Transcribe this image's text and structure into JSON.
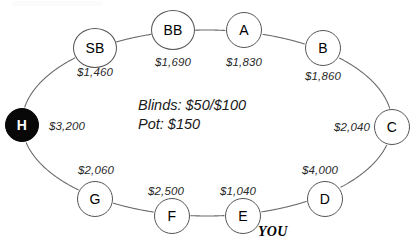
{
  "diagram": {
    "title_artifact": "",
    "center_info": {
      "blinds_line": "Blinds: $50/$100",
      "pot_line": "Pot: $150"
    },
    "hero_marker": "YOU",
    "dealer_seat_id": "H",
    "seats": [
      {
        "id": "SB",
        "label": "SB",
        "stack": "$1,460",
        "cx": 95,
        "cy": 48,
        "sx": 95,
        "sy": 72,
        "dealer": false,
        "wide": true
      },
      {
        "id": "BB",
        "label": "BB",
        "stack": "$1,690",
        "cx": 173,
        "cy": 30,
        "sx": 173,
        "sy": 62,
        "dealer": false,
        "wide": true
      },
      {
        "id": "A",
        "label": "A",
        "stack": "$1,830",
        "cx": 244,
        "cy": 30,
        "sx": 244,
        "sy": 62,
        "dealer": false,
        "wide": false
      },
      {
        "id": "B",
        "label": "B",
        "stack": "$1,860",
        "cx": 323,
        "cy": 48,
        "sx": 323,
        "sy": 76,
        "dealer": false,
        "wide": false
      },
      {
        "id": "C",
        "label": "C",
        "stack": "$2,040",
        "cx": 392,
        "cy": 127,
        "sx": 352,
        "sy": 127,
        "dealer": false,
        "wide": false
      },
      {
        "id": "D",
        "label": "D",
        "stack": "$4,000",
        "cx": 325,
        "cy": 199,
        "sx": 320,
        "sy": 170,
        "dealer": false,
        "wide": false
      },
      {
        "id": "E",
        "label": "E",
        "stack": "$1,040",
        "cx": 243,
        "cy": 216,
        "sx": 238,
        "sy": 191,
        "dealer": false,
        "wide": false
      },
      {
        "id": "F",
        "label": "F",
        "stack": "$2,500",
        "cx": 172,
        "cy": 216,
        "sx": 166,
        "sy": 191,
        "dealer": false,
        "wide": false
      },
      {
        "id": "G",
        "label": "G",
        "stack": "$2,060",
        "cx": 95,
        "cy": 199,
        "sx": 96,
        "sy": 170,
        "dealer": false,
        "wide": false
      },
      {
        "id": "H",
        "label": "H",
        "stack": "$3,200",
        "cx": 22,
        "cy": 125,
        "sx": 67,
        "sy": 126,
        "dealer": true,
        "wide": false
      }
    ],
    "table_outline": {
      "shape": "ellipse",
      "cx": 207,
      "cy": 123,
      "rx": 185,
      "ry": 93,
      "stroke": "#6b6b6b"
    }
  }
}
